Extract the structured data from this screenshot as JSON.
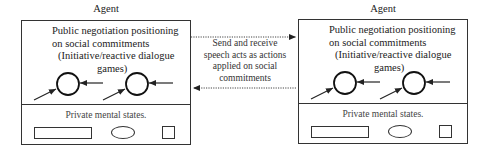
{
  "agents": [
    {
      "title": "Agent",
      "public_lines": [
        "Public negotiation positioning",
        "on social commitments",
        "(Initiative/reactive dialogue",
        "games)"
      ],
      "private_label": "Private mental states."
    },
    {
      "title": "Agent",
      "public_lines": [
        "Public negotiation positioning",
        "on social commitments",
        "(Initiative/reactive dialogue",
        "games)"
      ],
      "private_label": "Private mental states."
    }
  ],
  "middle": {
    "lines": [
      "Send and receive",
      "speech acts as actions",
      "applied on social",
      "commitments"
    ]
  },
  "colors": {
    "stroke": "#333333",
    "text": "#222222",
    "background": "#ffffff"
  }
}
